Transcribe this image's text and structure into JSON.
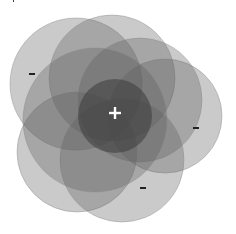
{
  "diagram": {
    "type": "overlapping-circles",
    "center_symbol": "+",
    "outer_symbols": [
      "-",
      "-",
      "-"
    ],
    "colors": {
      "circle_fill": "#5a5a5a",
      "circle_stroke": "#888888",
      "center_fill": "#3a3a3a",
      "symbol_light": "#ffffff",
      "symbol_dark": "#222222"
    },
    "circles": [
      {
        "id": "top-left",
        "cx": 76,
        "cy": 84,
        "r": 66
      },
      {
        "id": "top",
        "cx": 112,
        "cy": 78,
        "r": 63
      },
      {
        "id": "right",
        "cx": 165,
        "cy": 116,
        "r": 57
      },
      {
        "id": "top-right",
        "cx": 140,
        "cy": 100,
        "r": 62
      },
      {
        "id": "bottom-left",
        "cx": 77,
        "cy": 152,
        "r": 60
      },
      {
        "id": "bottom",
        "cx": 122,
        "cy": 160,
        "r": 62
      },
      {
        "id": "left-mid",
        "cx": 95,
        "cy": 120,
        "r": 72
      }
    ],
    "center_circle": {
      "cx": 115,
      "cy": 116,
      "r": 37
    },
    "symbols": [
      {
        "label": "+",
        "x": 115,
        "y": 113
      },
      {
        "label": "-",
        "x": 32,
        "y": 74
      },
      {
        "label": "-",
        "x": 196,
        "y": 128
      },
      {
        "label": "-",
        "x": 143,
        "y": 188
      }
    ]
  }
}
